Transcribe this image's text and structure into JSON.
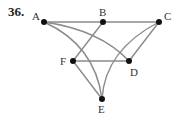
{
  "problem_number": "36.",
  "graph": {
    "nodes": [
      {
        "id": "A",
        "label": "A",
        "x": 44,
        "y": 22,
        "lx": 31,
        "ly": 20
      },
      {
        "id": "B",
        "label": "B",
        "x": 103,
        "y": 22,
        "lx": 99,
        "ly": 16
      },
      {
        "id": "C",
        "label": "C",
        "x": 159,
        "y": 22,
        "lx": 164,
        "ly": 20
      },
      {
        "id": "F",
        "label": "F",
        "x": 73,
        "y": 61,
        "lx": 60,
        "ly": 66
      },
      {
        "id": "D",
        "label": "D",
        "x": 129,
        "y": 61,
        "lx": 130,
        "ly": 76
      },
      {
        "id": "E",
        "label": "E",
        "x": 102,
        "y": 99,
        "lx": 98,
        "ly": 113
      }
    ],
    "edges": [
      {
        "from": "A",
        "to": "B"
      },
      {
        "from": "B",
        "to": "C"
      },
      {
        "from": "A",
        "to": "D",
        "curve": true
      },
      {
        "from": "A",
        "to": "E",
        "curve": true
      },
      {
        "from": "B",
        "to": "F"
      },
      {
        "from": "C",
        "to": "D"
      },
      {
        "from": "C",
        "to": "E",
        "curve": true
      },
      {
        "from": "F",
        "to": "D"
      },
      {
        "from": "F",
        "to": "E"
      }
    ],
    "edge_color": "#8a8a8a",
    "node_color": "#111111"
  }
}
